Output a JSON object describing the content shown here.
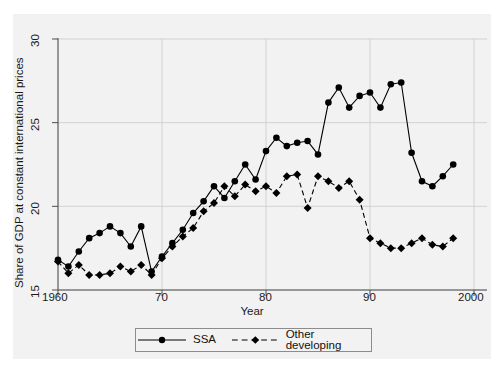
{
  "chart_data": {
    "type": "line",
    "title": "",
    "xlabel": "Year",
    "ylabel": "Share of GDP at constant international prices",
    "xlim": [
      1958,
      2000
    ],
    "ylim": [
      14.0,
      30.5
    ],
    "xticks": [
      1960,
      1970,
      1980,
      1990,
      2000
    ],
    "xticklabels": [
      "1960",
      "70",
      "80",
      "90",
      "2000"
    ],
    "yticks": [
      15,
      20,
      25,
      30
    ],
    "yticklabels": [
      "15",
      "20",
      "25",
      "30"
    ],
    "grid": true,
    "grid_axis": "both",
    "legend_position": "below-center",
    "x": [
      1960,
      1961,
      1962,
      1963,
      1964,
      1965,
      1966,
      1967,
      1968,
      1969,
      1970,
      1971,
      1972,
      1973,
      1974,
      1975,
      1976,
      1977,
      1978,
      1979,
      1980,
      1981,
      1982,
      1983,
      1984,
      1985,
      1986,
      1987,
      1988,
      1989,
      1990,
      1991,
      1992,
      1993,
      1994,
      1995,
      1996,
      1997,
      1998
    ],
    "series": [
      {
        "name": "SSA",
        "marker": "circle",
        "linestyle": "solid",
        "color": "#000000",
        "values": [
          16.8,
          16.4,
          17.3,
          18.1,
          18.4,
          18.8,
          18.4,
          17.6,
          18.8,
          16.1,
          17.0,
          17.8,
          18.6,
          19.6,
          20.3,
          21.2,
          20.5,
          21.5,
          22.5,
          21.6,
          23.3,
          24.1,
          23.6,
          23.8,
          23.9,
          23.1,
          26.2,
          27.1,
          25.9,
          26.6,
          26.8,
          25.9,
          27.3,
          27.4,
          23.2,
          21.5,
          21.2,
          21.8,
          22.5
        ]
      },
      {
        "name": "Other developing",
        "marker": "diamond",
        "linestyle": "dashed",
        "color": "#000000",
        "values": [
          16.7,
          16.0,
          16.5,
          15.9,
          15.9,
          16.0,
          16.4,
          16.1,
          16.5,
          15.9,
          16.9,
          17.6,
          18.2,
          18.7,
          19.7,
          20.2,
          21.2,
          20.6,
          21.3,
          20.9,
          21.2,
          20.8,
          21.8,
          21.9,
          19.9,
          21.8,
          21.5,
          21.1,
          21.5,
          20.4,
          18.1,
          17.8,
          17.5,
          17.5,
          17.8,
          18.1,
          17.7,
          17.6,
          18.1
        ]
      }
    ]
  },
  "legend": {
    "items": [
      {
        "label": "SSA"
      },
      {
        "label": "Other developing"
      }
    ]
  },
  "axes": {
    "xlabel": "Year",
    "ylabel": "Share of GDP at constant international prices"
  }
}
